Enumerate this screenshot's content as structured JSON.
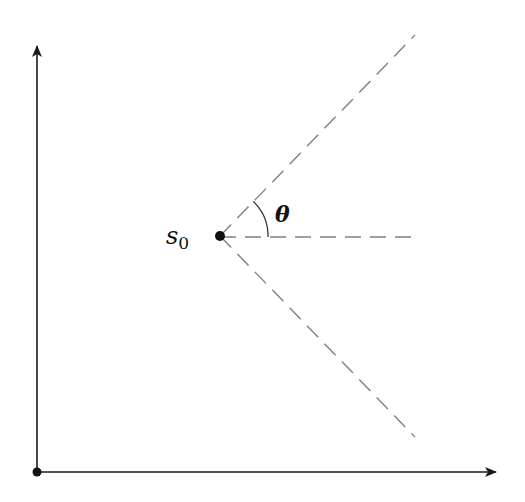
{
  "diagram": {
    "labels": {
      "point": "s",
      "point_subscript": "0",
      "angle": "θ"
    },
    "colors": {
      "axis": "#1a1a1a",
      "dashed": "#808080",
      "point": "#111111",
      "arc": "#333333",
      "background": "#ffffff"
    },
    "geometry": {
      "origin": [
        37,
        472
      ],
      "y_axis_tip": [
        37,
        45
      ],
      "x_axis_tip": [
        497,
        472
      ],
      "point_s0": [
        220,
        236
      ],
      "upper_ray_end": [
        415,
        35
      ],
      "horizontal_ray_end": [
        415,
        237
      ],
      "lower_ray_end": [
        415,
        437
      ],
      "arc_radius": 48
    }
  }
}
